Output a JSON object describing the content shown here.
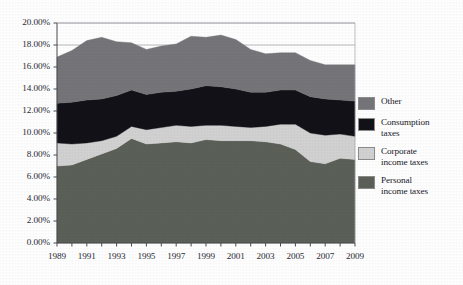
{
  "chart_data": {
    "type": "area",
    "stacked": true,
    "title": "",
    "subtitle": "",
    "xlabel": "",
    "ylabel": "",
    "x": [
      1989,
      1990,
      1991,
      1992,
      1993,
      1994,
      1995,
      1996,
      1997,
      1998,
      1999,
      2000,
      2001,
      2002,
      2003,
      2004,
      2005,
      2006,
      2007,
      2008,
      2009
    ],
    "xlim": [
      1989,
      2009
    ],
    "ylim": [
      0,
      20
    ],
    "ytick_values": [
      0,
      2,
      4,
      6,
      8,
      10,
      12,
      14,
      16,
      18,
      20
    ],
    "ytick_labels": [
      "0.00%",
      "2.00%",
      "4.00%",
      "6.00%",
      "8.00%",
      "10.00%",
      "12.00%",
      "14.00%",
      "16.00%",
      "18.00%",
      "20.00%"
    ],
    "xtick_values": [
      1989,
      1991,
      1993,
      1995,
      1997,
      1999,
      2001,
      2003,
      2005,
      2007,
      2009
    ],
    "xtick_labels": [
      "1989",
      "1991",
      "1993",
      "1995",
      "1997",
      "1999",
      "2001",
      "2003",
      "2005",
      "2007",
      "2009"
    ],
    "grid": "horizontal",
    "legend_position": "right",
    "series": [
      {
        "name": "Personal income taxes",
        "order": 1,
        "color": "#5b6058",
        "values": [
          7.0,
          7.1,
          7.6,
          8.1,
          8.6,
          9.5,
          9.0,
          9.1,
          9.2,
          9.1,
          9.4,
          9.3,
          9.3,
          9.3,
          9.2,
          9.0,
          8.5,
          7.4,
          7.2,
          7.7,
          7.6
        ]
      },
      {
        "name": "Corporate income taxes",
        "order": 2,
        "color": "#d2d2d2",
        "values": [
          2.1,
          1.9,
          1.5,
          1.2,
          1.1,
          1.1,
          1.3,
          1.4,
          1.5,
          1.5,
          1.3,
          1.4,
          1.3,
          1.2,
          1.4,
          1.8,
          2.3,
          2.6,
          2.6,
          2.2,
          2.1
        ]
      },
      {
        "name": "Consumption taxes",
        "order": 3,
        "color": "#121218",
        "values": [
          3.6,
          3.8,
          3.9,
          3.8,
          3.7,
          3.3,
          3.2,
          3.2,
          3.1,
          3.4,
          3.6,
          3.5,
          3.4,
          3.2,
          3.1,
          3.1,
          3.1,
          3.3,
          3.3,
          3.1,
          3.2
        ]
      },
      {
        "name": "Other",
        "order": 4,
        "color": "#76767a",
        "values": [
          4.2,
          4.7,
          5.4,
          5.6,
          4.9,
          4.3,
          4.1,
          4.2,
          4.3,
          4.8,
          4.4,
          4.7,
          4.5,
          3.9,
          3.5,
          3.4,
          3.4,
          3.3,
          3.1,
          3.2,
          3.3
        ]
      }
    ],
    "legend": [
      {
        "label_lines": [
          "Other"
        ],
        "color": "#76767a"
      },
      {
        "label_lines": [
          "Consumption",
          "taxes"
        ],
        "color": "#121218"
      },
      {
        "label_lines": [
          "Corporate",
          "income taxes"
        ],
        "color": "#d2d2d2"
      },
      {
        "label_lines": [
          "Personal",
          "income taxes"
        ],
        "color": "#5b6058"
      }
    ],
    "axis_color": "#4a4a52",
    "grid_color": "#a8a8ae",
    "background": "#ffffff"
  }
}
